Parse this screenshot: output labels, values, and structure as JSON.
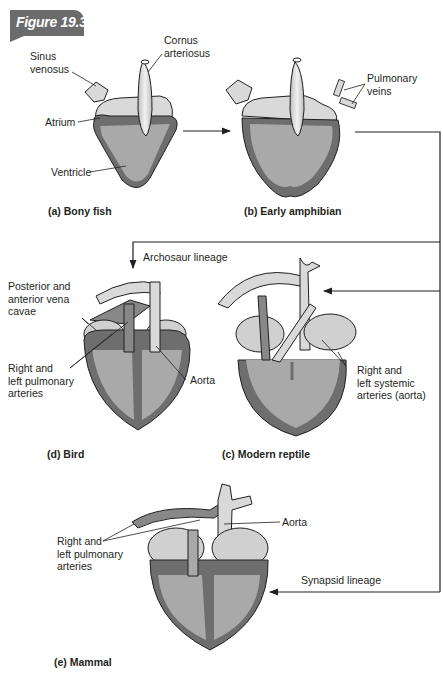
{
  "figure": {
    "number_label": "Figure 19.30"
  },
  "panels": {
    "a": {
      "caption": "(a) Bony fish",
      "labels": {
        "sinus": "Sinus\nvenosus",
        "cornus": "Cornus\narteriosus",
        "atrium": "Atrium",
        "ventricle": "Ventricle"
      }
    },
    "b": {
      "caption": "(b) Early amphibian",
      "labels": {
        "pulmonary_veins": "Pulmonary\nveins"
      }
    },
    "c": {
      "caption": "(c) Modern reptile",
      "labels": {
        "systemic": "Right and\nleft systemic\narteries (aorta)"
      }
    },
    "d": {
      "caption": "(d) Bird",
      "labels": {
        "vena_cavae": "Posterior and\nanterior vena\ncavae",
        "pulmonary_arteries": "Right and\nleft pulmonary\narteries",
        "aorta": "Aorta"
      }
    },
    "e": {
      "caption": "(e) Mammal",
      "labels": {
        "pulmonary_arteries": "Right and\nleft pulmonary\narteries",
        "aorta": "Aorta"
      }
    }
  },
  "lineages": {
    "archosaur": "Archosaur lineage",
    "synapsid": "Synapsid lineage"
  },
  "colors": {
    "outer_wall": "#6e6e6e",
    "chamber": "#a9a9a9",
    "vessel_light": "#d9d9d9",
    "badge": "#6b6b6b",
    "line": "#231f20"
  }
}
